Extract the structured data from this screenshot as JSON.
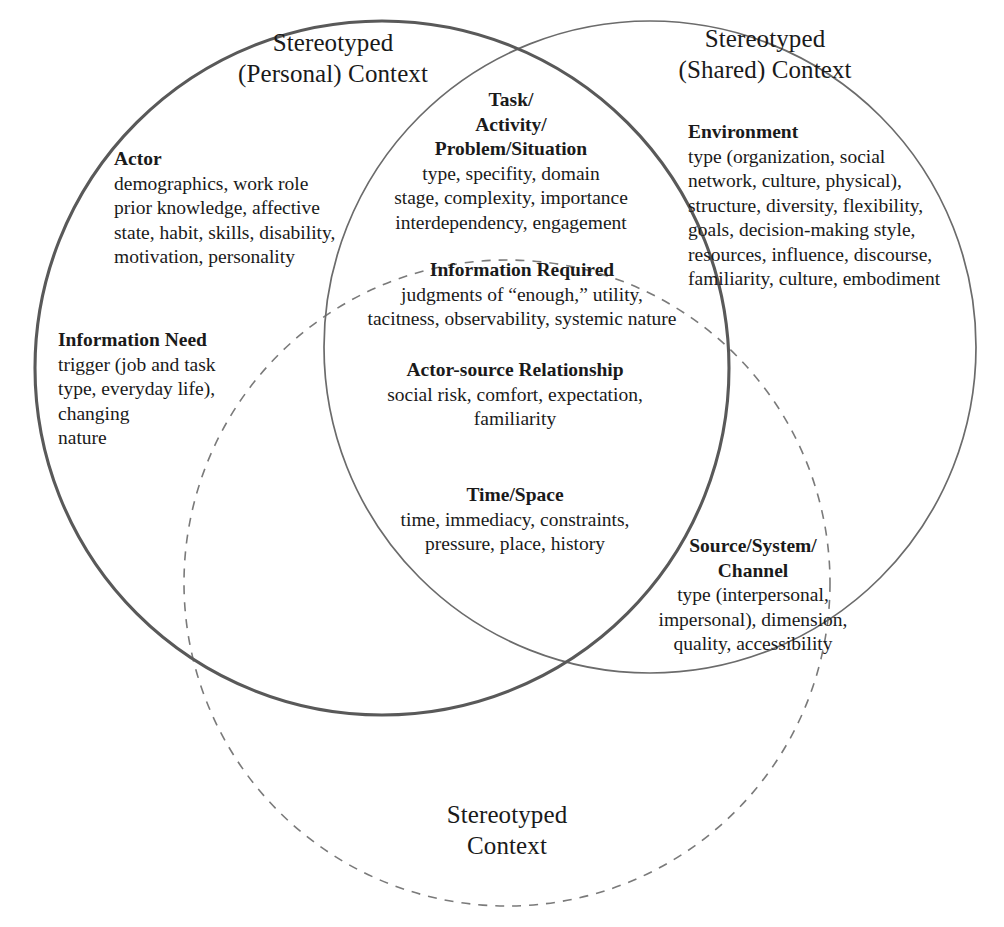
{
  "diagram": {
    "type": "venn",
    "title_personal": {
      "line1": "Stereotyped",
      "line2": "(Personal) Context"
    },
    "title_shared": {
      "line1": "Stereotyped",
      "line2": "(Shared) Context"
    },
    "title_dashed": {
      "line1": "Stereotyped",
      "line2": "Context"
    },
    "colors": {
      "left_circle_stroke": "#595959",
      "right_circle_stroke": "#6b6b6b",
      "dashed_circle_stroke": "#7a7a7a",
      "text": "#1a1a1a",
      "background": "#ffffff"
    },
    "blocks": [
      {
        "id": "actor",
        "heading": "Actor",
        "lines": [
          "demographics, work role",
          "prior knowledge, affective",
          "state, habit, skills, disability,",
          "motivation, personality"
        ]
      },
      {
        "id": "information-need",
        "heading": "Information Need",
        "lines": [
          "trigger (job and task",
          "type, everyday life),",
          "changing",
          "nature"
        ]
      },
      {
        "id": "task-activity-problem-situation",
        "heading_lines": [
          "Task/",
          "Activity/",
          "Problem/Situation"
        ],
        "lines": [
          "type, specifity, domain",
          "stage, complexity, importance",
          "interdependency, engagement"
        ]
      },
      {
        "id": "environment",
        "heading": "Environment",
        "lines": [
          "type (organization, social",
          "network, culture, physical),",
          "structure, diversity, flexibility,",
          "goals, decision-making style,",
          "resources, influence, discourse,",
          "familiarity, culture, embodiment"
        ]
      },
      {
        "id": "information-required",
        "heading": "Information Required",
        "lines": [
          "judgments of “enough,” utility,",
          "tacitness, observability, systemic nature"
        ]
      },
      {
        "id": "actor-source-relationship",
        "heading": "Actor-source Relationship",
        "lines": [
          "social risk, comfort, expectation,",
          "familiarity"
        ]
      },
      {
        "id": "time-space",
        "heading": "Time/Space",
        "lines": [
          "time, immediacy, constraints,",
          "pressure, place, history"
        ]
      },
      {
        "id": "source-system-channel",
        "heading_lines": [
          "Source/System/",
          "Channel"
        ],
        "lines": [
          "type (interpersonal,",
          "impersonal), dimension,",
          "quality, accessibility"
        ]
      }
    ]
  }
}
